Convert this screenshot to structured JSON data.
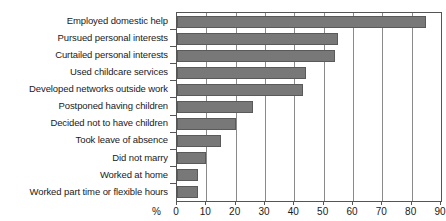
{
  "chart_data": {
    "type": "bar",
    "orientation": "horizontal",
    "title": "",
    "xlabel": "%",
    "ylabel": "",
    "xlim": [
      0,
      90
    ],
    "xticks": [
      0,
      10,
      20,
      30,
      40,
      50,
      60,
      70,
      80,
      90
    ],
    "grid": true,
    "legend": false,
    "bar_color": "#787878",
    "bar_border_color": "#5a5a5a",
    "axis_color": "#555555",
    "text_color": "#1a1a1a",
    "categories": [
      "Employed domestic help",
      "Pursued personal interests",
      "Curtailed personal interests",
      "Used childcare services",
      "Developed networks outside work",
      "Postponed having children",
      "Decided not to have children",
      "Took leave of absence",
      "Did not marry",
      "Worked at home",
      "Worked part time or flexible hours"
    ],
    "values": [
      85,
      55,
      54,
      44,
      43,
      26,
      20,
      15,
      10,
      7,
      7
    ]
  },
  "axis": {
    "unit_label": "%",
    "tick_labels": [
      "0",
      "10",
      "20",
      "30",
      "40",
      "50",
      "60",
      "70",
      "80",
      "90"
    ]
  }
}
